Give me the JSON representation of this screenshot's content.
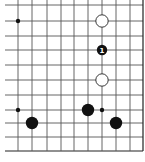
{
  "diagram": {
    "type": "go-board-fragment",
    "open_sides": [
      "top",
      "left"
    ],
    "board_edges": [
      "right",
      "bottom"
    ],
    "grid": {
      "columns_x": [
        18,
        32,
        47,
        61,
        74,
        88,
        102,
        116,
        130,
        143
      ],
      "rows_y": [
        5,
        21,
        36,
        50,
        65,
        80,
        95,
        110,
        123,
        137,
        151
      ],
      "line_color": "#555555"
    },
    "stones": [
      {
        "color": "white",
        "col": 6,
        "row": 1,
        "label": ""
      },
      {
        "color": "black",
        "col": 6,
        "row": 3,
        "label": "1"
      },
      {
        "color": "white",
        "col": 6,
        "row": 5,
        "label": ""
      },
      {
        "color": "black",
        "col": 5,
        "row": 7,
        "label": ""
      },
      {
        "color": "black",
        "col": 1,
        "row": 8,
        "label": ""
      },
      {
        "color": "black",
        "col": 7,
        "row": 8,
        "label": ""
      }
    ],
    "markers": [
      {
        "type": "small-dot",
        "col": 0,
        "row": 1
      },
      {
        "type": "small-dot",
        "col": 0,
        "row": 7
      },
      {
        "type": "small-dot",
        "col": 6,
        "row": 7
      }
    ],
    "colors": {
      "black_stone": "#111111",
      "white_stone": "#ffffff",
      "outline": "#222222"
    }
  }
}
